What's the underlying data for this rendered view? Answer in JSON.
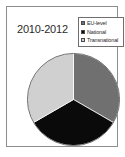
{
  "chart_data": {
    "type": "pie",
    "title": "2010-2012",
    "xlabel": "",
    "ylabel": "",
    "categories": [
      "EU-level",
      "National",
      "Transnational"
    ],
    "values": [
      33.3,
      33.3,
      33.4
    ],
    "colors": [
      "#707070",
      "#0a0a0a",
      "#d0d0d0"
    ],
    "legend_position": "top-right",
    "grid": false,
    "start_angle_deg": 0,
    "direction": "clockwise",
    "slices": [
      {
        "label": "EU-level",
        "value": 33.3,
        "color": "#707070",
        "start_deg": 0,
        "end_deg": 120
      },
      {
        "label": "National",
        "value": 33.3,
        "color": "#0a0a0a",
        "start_deg": 120,
        "end_deg": 240
      },
      {
        "label": "Transnational",
        "value": 33.4,
        "color": "#d0d0d0",
        "start_deg": 240,
        "end_deg": 360
      }
    ]
  },
  "title": {
    "text": "2010-2012"
  },
  "legend": {
    "items": [
      {
        "label": "EU-level",
        "color": "#707070"
      },
      {
        "label": "National",
        "color": "#0a0a0a"
      },
      {
        "label": "Transnational",
        "color": "#d0d0d0"
      }
    ]
  },
  "frame": {
    "border_color": "#8d8d8d",
    "background": "#ffffff"
  }
}
